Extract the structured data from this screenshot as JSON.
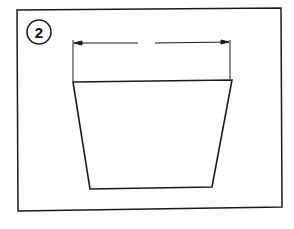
{
  "figure": {
    "step_number": "2",
    "colors": {
      "stroke": "#1a1a1a",
      "background": "#ffffff"
    }
  }
}
